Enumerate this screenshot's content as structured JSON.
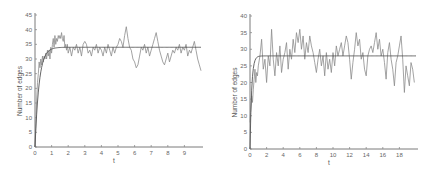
{
  "chart_data": [
    {
      "type": "line",
      "title": "",
      "xlabel": "t",
      "ylabel": "Number of edges",
      "xlim": [
        0,
        10
      ],
      "ylim": [
        0,
        45
      ],
      "xticks": [
        0,
        1,
        2,
        3,
        4,
        5,
        6,
        7,
        8,
        9
      ],
      "yticks": [
        0,
        5,
        10,
        15,
        20,
        25,
        30,
        35,
        40,
        45
      ],
      "grid": false,
      "series": [
        {
          "name": "simulation",
          "x": [
            0,
            0.05,
            0.1,
            0.15,
            0.2,
            0.25,
            0.3,
            0.35,
            0.4,
            0.45,
            0.5,
            0.55,
            0.6,
            0.65,
            0.7,
            0.75,
            0.8,
            0.85,
            0.9,
            0.95,
            1.0,
            1.05,
            1.1,
            1.15,
            1.2,
            1.25,
            1.3,
            1.35,
            1.4,
            1.45,
            1.5,
            1.55,
            1.6,
            1.65,
            1.7,
            1.75,
            1.8,
            1.85,
            1.9,
            1.95,
            2.0,
            2.1,
            2.2,
            2.3,
            2.4,
            2.5,
            2.6,
            2.7,
            2.8,
            2.9,
            3.0,
            3.1,
            3.2,
            3.3,
            3.4,
            3.5,
            3.6,
            3.7,
            3.8,
            3.9,
            4.0,
            4.1,
            4.2,
            4.3,
            4.4,
            4.5,
            4.6,
            4.7,
            4.8,
            4.9,
            5.0,
            5.1,
            5.2,
            5.3,
            5.4,
            5.5,
            5.6,
            5.7,
            5.8,
            5.9,
            6.0,
            6.1,
            6.2,
            6.3,
            6.4,
            6.5,
            6.6,
            6.7,
            6.8,
            6.9,
            7.0,
            7.1,
            7.2,
            7.3,
            7.4,
            7.5,
            7.6,
            7.7,
            7.8,
            7.9,
            8.0,
            8.1,
            8.2,
            8.3,
            8.4,
            8.5,
            8.6,
            8.7,
            8.8,
            8.9,
            9.0,
            9.1,
            9.2,
            9.3,
            9.4,
            9.5,
            9.6,
            9.7,
            9.8,
            9.9,
            10.0
          ],
          "y": [
            0,
            8,
            16,
            22,
            25,
            29,
            27,
            30,
            28,
            31,
            29,
            31,
            30,
            32,
            30,
            33,
            31,
            33,
            30,
            34,
            32,
            35,
            37,
            34,
            38,
            35,
            37,
            36,
            38,
            37,
            38,
            37,
            39,
            37,
            36,
            38,
            34,
            35,
            33,
            35,
            32,
            34,
            31,
            34,
            33,
            35,
            32,
            34,
            31,
            35,
            36,
            35,
            32,
            33,
            31,
            34,
            33,
            35,
            32,
            34,
            33,
            31,
            34,
            32,
            35,
            33,
            31,
            34,
            32,
            34,
            35,
            37,
            36,
            34,
            38,
            41,
            37,
            34,
            33,
            30,
            29,
            27,
            28,
            31,
            34,
            33,
            35,
            32,
            34,
            31,
            33,
            35,
            37,
            39,
            36,
            33,
            31,
            29,
            28,
            30,
            32,
            29,
            31,
            33,
            32,
            34,
            33,
            35,
            32,
            34,
            33,
            35,
            31,
            33,
            32,
            34,
            36,
            33,
            30,
            28,
            26
          ]
        },
        {
          "name": "fitted",
          "model": "34*(1-exp(-4t))",
          "asymptote": 34
        }
      ]
    },
    {
      "type": "line",
      "title": "",
      "xlabel": "t",
      "ylabel": "Number of edges",
      "xlim": [
        0,
        20
      ],
      "ylim": [
        0,
        40
      ],
      "xticks": [
        0,
        2,
        4,
        6,
        8,
        10,
        12,
        14,
        16,
        18
      ],
      "yticks": [
        0,
        5,
        10,
        15,
        20,
        25,
        30,
        35,
        40
      ],
      "grid": false,
      "series": [
        {
          "name": "simulation",
          "x": [
            0,
            0.1,
            0.2,
            0.3,
            0.4,
            0.5,
            0.6,
            0.7,
            0.8,
            0.9,
            1.0,
            1.2,
            1.4,
            1.6,
            1.8,
            2.0,
            2.2,
            2.4,
            2.6,
            2.8,
            3.0,
            3.2,
            3.4,
            3.6,
            3.8,
            4.0,
            4.2,
            4.4,
            4.6,
            4.8,
            5.0,
            5.2,
            5.4,
            5.6,
            5.8,
            6.0,
            6.2,
            6.4,
            6.6,
            6.8,
            7.0,
            7.2,
            7.4,
            7.6,
            7.8,
            8.0,
            8.2,
            8.4,
            8.6,
            8.8,
            9.0,
            9.2,
            9.4,
            9.6,
            9.8,
            10.0,
            10.2,
            10.4,
            10.6,
            10.8,
            11.0,
            11.2,
            11.4,
            11.6,
            11.8,
            12.0,
            12.2,
            12.4,
            12.6,
            12.8,
            13.0,
            13.2,
            13.4,
            13.6,
            13.8,
            14.0,
            14.2,
            14.4,
            14.6,
            14.8,
            15.0,
            15.2,
            15.4,
            15.6,
            15.8,
            16.0,
            16.2,
            16.4,
            16.6,
            16.8,
            17.0,
            17.2,
            17.4,
            17.6,
            17.8,
            18.0,
            18.2,
            18.4,
            18.6,
            18.8,
            19.0,
            19.2,
            19.4,
            19.6,
            19.8
          ],
          "y": [
            8,
            12,
            16,
            14,
            18,
            21,
            24,
            20,
            23,
            22,
            25,
            28,
            33,
            24,
            27,
            20,
            28,
            25,
            36,
            27,
            22,
            29,
            25,
            31,
            23,
            27,
            29,
            32,
            24,
            30,
            27,
            33,
            29,
            35,
            32,
            36,
            30,
            34,
            27,
            32,
            29,
            34,
            31,
            29,
            26,
            23,
            27,
            30,
            25,
            28,
            22,
            29,
            24,
            27,
            23,
            29,
            25,
            31,
            28,
            30,
            32,
            28,
            31,
            34,
            32,
            27,
            21,
            26,
            30,
            35,
            31,
            33,
            27,
            29,
            24,
            22,
            28,
            30,
            31,
            29,
            32,
            35,
            30,
            33,
            28,
            30,
            26,
            21,
            29,
            32,
            27,
            24,
            19,
            26,
            28,
            31,
            34,
            27,
            17,
            25,
            22,
            19,
            26,
            24,
            20
          ],
          "note": "noisy fluctuation around fitted equilibrium"
        },
        {
          "name": "fitted",
          "model": "28*(1-exp(-5t))",
          "asymptote": 28
        }
      ]
    }
  ]
}
